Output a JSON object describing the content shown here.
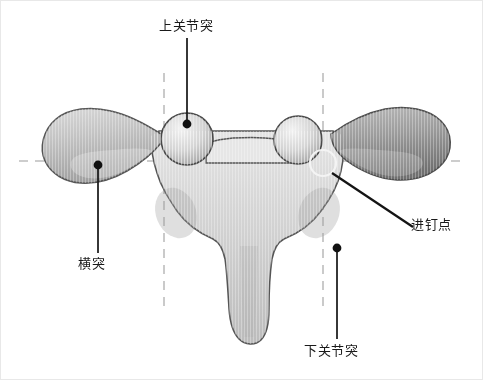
{
  "figure": {
    "type": "anatomical-diagram",
    "background_color": "#ffffff",
    "bone_fill_light": "#e9e9e9",
    "bone_fill_mid": "#c2c2c2",
    "bone_fill_dark": "#7d7d7d",
    "outline_color": "#4a4a4a",
    "guide_line_color": "#bdbdbd",
    "leader_line_color": "#141414",
    "marker_color": "#111111"
  },
  "labels": {
    "superior_articular_process": "上关节突",
    "transverse_process": "横突",
    "screw_entry_point": "进钉点",
    "inferior_articular_process": "下关节突"
  },
  "markers": {
    "superior_articular_dot": {
      "x": 186,
      "y": 123
    },
    "transverse_dot": {
      "x": 97,
      "y": 164
    },
    "inferior_articular_dot": {
      "x": 336,
      "y": 247
    },
    "entry_point_circle": {
      "cx": 322,
      "cy": 162,
      "r": 13
    }
  },
  "guides": {
    "horizontal_axis_y": 160,
    "vertical_left_x": 163,
    "vertical_right_x": 322
  },
  "leaders": {
    "superior": {
      "x1": 186,
      "y1": 37,
      "x2": 186,
      "y2": 123
    },
    "transverse": {
      "x1": 97,
      "y1": 164,
      "x2": 97,
      "y2": 252
    },
    "entry": {
      "x1": 331,
      "y1": 172,
      "x2": 412,
      "y2": 226
    },
    "inferior": {
      "x1": 336,
      "y1": 247,
      "x2": 336,
      "y2": 338
    }
  }
}
